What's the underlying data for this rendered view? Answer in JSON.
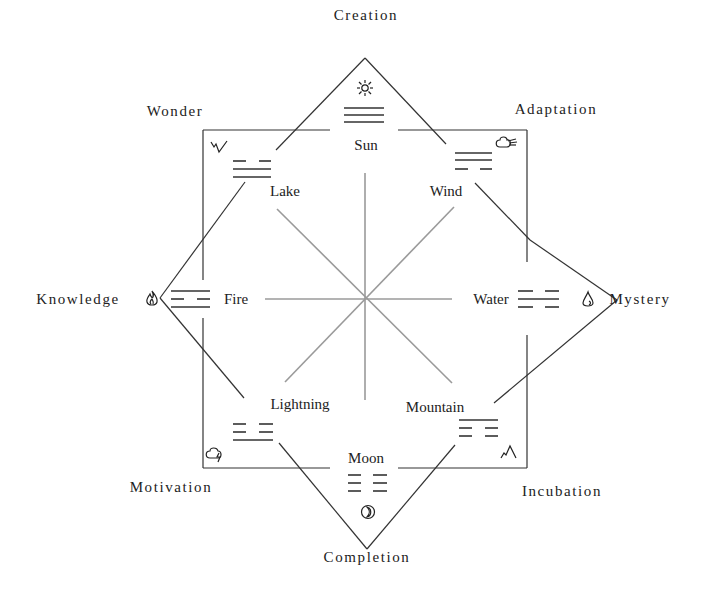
{
  "diagram": {
    "type": "bagua-cycle",
    "outer_labels": {
      "top": "Creation",
      "top_right": "Adaptation",
      "right": "Mystery",
      "bottom_right": "Incubation",
      "bottom": "Completion",
      "bottom_left": "Motivation",
      "left": "Knowledge",
      "top_left": "Wonder"
    },
    "elements": [
      {
        "position": "top",
        "name": "Sun",
        "trigram": "solid-solid-solid",
        "icon": "sun-icon"
      },
      {
        "position": "top_right",
        "name": "Wind",
        "trigram": "solid-solid-broken",
        "icon": "wind-cloud-icon"
      },
      {
        "position": "right",
        "name": "Water",
        "trigram": "broken-solid-broken",
        "icon": "water-drop-icon"
      },
      {
        "position": "bottom_right",
        "name": "Mountain",
        "trigram": "solid-broken-broken",
        "icon": "mountain-icon"
      },
      {
        "position": "bottom",
        "name": "Moon",
        "trigram": "broken-broken-broken",
        "icon": "moon-icon"
      },
      {
        "position": "bottom_left",
        "name": "Lightning",
        "trigram": "broken-broken-solid",
        "icon": "thunder-cloud-icon"
      },
      {
        "position": "left",
        "name": "Fire",
        "trigram": "solid-broken-solid",
        "icon": "flame-icon"
      },
      {
        "position": "top_left",
        "name": "Lake",
        "trigram": "broken-solid-solid",
        "icon": "lake-zigzag-icon"
      }
    ],
    "colors": {
      "frame": "#333333",
      "spokes": "#9a9a9a",
      "text": "#222222"
    }
  }
}
